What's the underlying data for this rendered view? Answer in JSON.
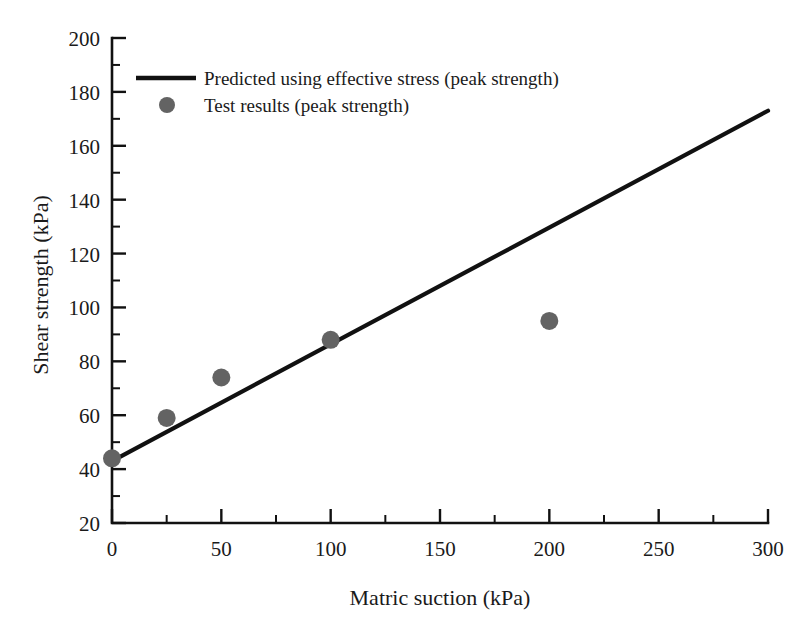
{
  "chart_data": {
    "type": "scatter",
    "title": "",
    "xlabel": "Matric suction (kPa)",
    "ylabel": "Shear strength (kPa)",
    "xlim": [
      0,
      300
    ],
    "ylim": [
      20,
      200
    ],
    "xticks": [
      0,
      50,
      100,
      150,
      200,
      250,
      300
    ],
    "xtick_labels": [
      "0",
      "50",
      "100",
      "150",
      "200",
      "250",
      "300"
    ],
    "x_minor_ticks": [
      25,
      75,
      125,
      175,
      225,
      275
    ],
    "yticks": [
      20,
      40,
      60,
      80,
      100,
      120,
      140,
      160,
      180,
      200
    ],
    "ytick_labels": [
      "20",
      "40",
      "60",
      "80",
      "100",
      "120",
      "140",
      "160",
      "180",
      "200"
    ],
    "y_minor_ticks": [
      30,
      50,
      70,
      90,
      110,
      130,
      150,
      170,
      190
    ],
    "grid": false,
    "legend_position": "upper-left-inside",
    "series": [
      {
        "name": "Predicted using effective stress (peak strength)",
        "type": "line",
        "color": "#111111",
        "x": [
          0,
          300
        ],
        "y": [
          43,
          173
        ]
      },
      {
        "name": "Test results (peak strength)",
        "type": "scatter",
        "color": "#636363",
        "marker": "circle",
        "x": [
          0,
          25,
          50,
          100,
          200
        ],
        "y": [
          44,
          59,
          74,
          88,
          95
        ]
      }
    ]
  },
  "legend": {
    "entries": [
      {
        "label": "Predicted using effective stress (peak strength)",
        "symbol": "line",
        "color": "#111111"
      },
      {
        "label": "Test results (peak strength)",
        "symbol": "circle",
        "color": "#636363"
      }
    ]
  },
  "axes": {
    "x_title": "Matric suction (kPa)",
    "y_title": "Shear strength (kPa)",
    "x_labels": [
      "0",
      "50",
      "100",
      "150",
      "200",
      "250",
      "300"
    ],
    "y_labels": [
      "20",
      "40",
      "60",
      "80",
      "100",
      "120",
      "140",
      "160",
      "180",
      "200"
    ]
  },
  "colors": {
    "line": "#111111",
    "marker": "#636363",
    "axis": "#111111",
    "background": "#ffffff",
    "text": "#1a1a1a"
  }
}
